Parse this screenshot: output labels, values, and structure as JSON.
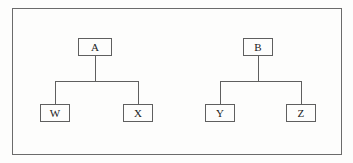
{
  "diagram": {
    "background_color": "#fdfdfc",
    "stroke_color": "#5f5f5f",
    "frame_stroke_color": "#6b6b6b",
    "text_color": "#1a1a1a",
    "frame": {
      "x": 12,
      "y": 8,
      "width": 330,
      "height": 147
    },
    "trees": [
      {
        "name": "left-tree",
        "root": {
          "id": "A",
          "label": "A",
          "x": 78,
          "y": 38,
          "width": 34,
          "height": 18
        },
        "children": [
          {
            "id": "W",
            "label": "W",
            "x": 40,
            "y": 104,
            "width": 30,
            "height": 18
          },
          {
            "id": "X",
            "label": "X",
            "x": 123,
            "y": 104,
            "width": 30,
            "height": 18
          }
        ],
        "connector": {
          "stem_x": 95,
          "stem_top": 56,
          "bar_y": 81,
          "bar_left": 55,
          "bar_right": 138
        }
      },
      {
        "name": "right-tree",
        "root": {
          "id": "B",
          "label": "B",
          "x": 243,
          "y": 38,
          "width": 30,
          "height": 18
        },
        "children": [
          {
            "id": "Y",
            "label": "Y",
            "x": 205,
            "y": 104,
            "width": 30,
            "height": 18
          },
          {
            "id": "Z",
            "label": "Z",
            "x": 286,
            "y": 104,
            "width": 30,
            "height": 18
          }
        ],
        "connector": {
          "stem_x": 258,
          "stem_top": 56,
          "bar_y": 81,
          "bar_left": 220,
          "bar_right": 301
        }
      }
    ]
  }
}
